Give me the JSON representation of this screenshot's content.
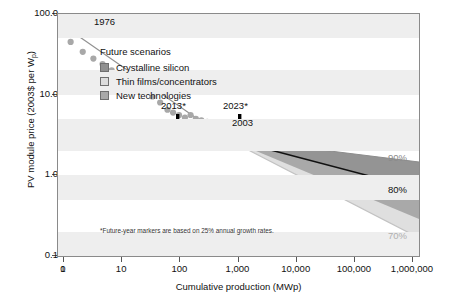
{
  "chart_data": {
    "type": "scatter",
    "title": "",
    "xlabel": "Cumulative production (MWp)",
    "ylabel": "PV module price (2003$ per Wp)",
    "xscale": "log",
    "yscale": "log",
    "xlim": [
      0.5,
      1000000
    ],
    "ylim": [
      0.1,
      100.0
    ],
    "grid": "horizontal-bands",
    "xticklabels": [
      "0",
      "1",
      "10",
      "100",
      "1,000",
      "10,000",
      "100,000",
      "1,000,000"
    ],
    "yticklabels": [
      "100.0",
      "10.0",
      "1.0",
      "0.1"
    ],
    "series": [
      {
        "name": "Historical PV module price",
        "type": "scatter",
        "color": "#a8a8a8",
        "points": [
          [
            0.85,
            70.0
          ],
          [
            1.3,
            45.0
          ],
          [
            2.1,
            34.0
          ],
          [
            3.2,
            28.0
          ],
          [
            4.6,
            24.0
          ],
          [
            6.6,
            20.0
          ],
          [
            9.5,
            17.0
          ],
          [
            13.0,
            15.0
          ],
          [
            19.0,
            12.0
          ],
          [
            24.0,
            11.5
          ],
          [
            27.0,
            10.8
          ],
          [
            33.0,
            9.5
          ],
          [
            45.0,
            8.0
          ],
          [
            60.0,
            6.5
          ],
          [
            75.0,
            6.0
          ],
          [
            95.0,
            5.6
          ],
          [
            120.0,
            5.2
          ],
          [
            150.0,
            5.6
          ],
          [
            185.0,
            5.0
          ],
          [
            230.0,
            4.8
          ],
          [
            290.0,
            4.6
          ],
          [
            360.0,
            4.4
          ],
          [
            450.0,
            4.3
          ],
          [
            560.0,
            4.2
          ],
          [
            700.0,
            4.1
          ],
          [
            880.0,
            4.0
          ],
          [
            1100.0,
            3.8
          ],
          [
            1400.0,
            3.6
          ],
          [
            1800.0,
            3.4
          ],
          [
            2300.0,
            3.2
          ],
          [
            3000.0,
            3.0
          ]
        ]
      },
      {
        "name": "Experience curve fit (80% progress ratio)",
        "type": "line",
        "color": "#8f8f8f",
        "x": [
          0.85,
          3000
        ],
        "y": [
          62.0,
          3.1
        ]
      },
      {
        "name": "90% progress ratio scenario",
        "type": "line",
        "color": "#9a9a9a",
        "x": [
          3000,
          1000000
        ],
        "y": [
          3.0,
          1.72
        ]
      },
      {
        "name": "80% progress ratio scenario (central)",
        "type": "line",
        "color": "#000000",
        "x": [
          3000,
          1000000
        ],
        "y": [
          3.0,
          0.95
        ]
      },
      {
        "name": "70% progress ratio scenario",
        "type": "line",
        "color": "#b9b9b9",
        "x": [
          3000,
          1000000
        ],
        "y": [
          3.0,
          0.48
        ]
      }
    ],
    "bands": [
      {
        "name": "Crystalline silicon",
        "color": "#909090",
        "from": "90%",
        "to": "80%-upper"
      },
      {
        "name": "Thin films/concentrators",
        "color": "#d9d9d9",
        "from": "80%",
        "to": "70%"
      },
      {
        "name": "New technologies",
        "color": "#a9a9a9",
        "from": "80%-lower",
        "to": "mid"
      }
    ],
    "annotations": [
      {
        "text": "1976",
        "x": 1.6,
        "y": 72.0,
        "kind": "point-label"
      },
      {
        "text": "2003",
        "x": 3600,
        "y": 3.6,
        "kind": "point-label"
      },
      {
        "text": "2013*",
        "x": 33000,
        "y": 4.4,
        "kind": "arrow-label"
      },
      {
        "text": "2023*",
        "x": 300000,
        "y": 4.4,
        "kind": "arrow-label"
      },
      {
        "text": "90%",
        "x": 1000000,
        "y": 1.72,
        "kind": "curve-label"
      },
      {
        "text": "80%",
        "x": 1000000,
        "y": 0.95,
        "kind": "curve-label"
      },
      {
        "text": "70%",
        "x": 1000000,
        "y": 0.46,
        "kind": "curve-label"
      }
    ]
  },
  "yaxis": {
    "title_prefix": "PV module price (2003$ per W",
    "title_sub": "p",
    "title_suffix": ")",
    "ticks": [
      {
        "label": "100.0",
        "value": 100.0
      },
      {
        "label": "10.0",
        "value": 10.0
      },
      {
        "label": "1.0",
        "value": 1.0
      },
      {
        "label": "0.1",
        "value": 0.1
      }
    ]
  },
  "xaxis": {
    "title": "Cumulative production (MWp)",
    "ticks": [
      {
        "label": "0",
        "value": 0
      },
      {
        "label": "1",
        "value": 1
      },
      {
        "label": "10",
        "value": 10
      },
      {
        "label": "100",
        "value": 100
      },
      {
        "label": "1,000",
        "value": 1000
      },
      {
        "label": "10,000",
        "value": 10000
      },
      {
        "label": "100,000",
        "value": 100000
      },
      {
        "label": "1,000,000",
        "value": 1000000
      }
    ]
  },
  "legend": {
    "title": "Future scenarios",
    "items": [
      {
        "label": "Crystalline silicon",
        "color": "#909090"
      },
      {
        "label": "Thin films/concentrators",
        "color": "#dcdcdc"
      },
      {
        "label": "New technologies",
        "color": "#a9a9a9"
      }
    ]
  },
  "labels": {
    "year_start": "1976",
    "year_current": "2003",
    "year_future_1": "2013*",
    "year_future_2": "2023*",
    "pct_90": "90%",
    "pct_80": "80%",
    "pct_70": "70%"
  },
  "footnote": "*Future-year markers are based on 25% annual growth rates.",
  "colors": {
    "data_point": "#a8a8a8",
    "trend_line": "#8f8f8f",
    "central_line": "#000000",
    "band_dark": "#909090",
    "band_light": "#dcdcdc",
    "band_mid": "#a9a9a9",
    "frame": "#8a8a8a",
    "stripe": "#eeeeee"
  }
}
